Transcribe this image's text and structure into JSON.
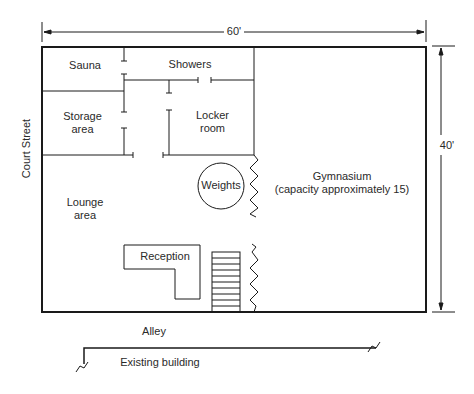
{
  "diagram": {
    "type": "floor-plan",
    "dimensions": {
      "width": "60'",
      "height": "40'"
    },
    "rooms": {
      "sauna": "Sauna",
      "showers": "Showers",
      "storage_line1": "Storage",
      "storage_line2": "area",
      "locker_line1": "Locker",
      "locker_line2": "room",
      "weights": "Weights",
      "gym_line1": "Gymnasium",
      "gym_line2": "(capacity approximately 15)",
      "lounge_line1": "Lounge",
      "lounge_line2": "area",
      "reception": "Reception"
    },
    "surroundings": {
      "street": "Court Street",
      "alley": "Alley",
      "existing_building": "Existing building"
    },
    "colors": {
      "line": "#1a1a1a",
      "text": "#2a2a2a",
      "background": "#ffffff"
    }
  }
}
